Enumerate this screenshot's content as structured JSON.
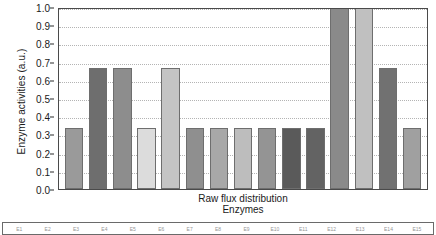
{
  "chart_data": {
    "type": "bar",
    "title": "Raw flux distribution",
    "xlabel": "Enzymes",
    "ylabel": "Enzyme activities (a.u.)",
    "ylim": [
      0.0,
      1.0
    ],
    "grid": true,
    "legend_position": "bottom",
    "ytick_labels": [
      "1.0",
      "0.9",
      "0.8",
      "0.7",
      "0.6",
      "0.5",
      "0.4",
      "0.3",
      "0.2",
      "0.1",
      "0.0"
    ],
    "ytick_values": [
      1.0,
      0.9,
      0.8,
      0.7,
      0.6,
      0.5,
      0.4,
      0.3,
      0.2,
      0.1,
      0.0
    ],
    "categories": [
      "E1",
      "E2",
      "E3",
      "E4",
      "E5",
      "E6",
      "E7",
      "E8",
      "E9",
      "E10",
      "E11",
      "E12",
      "E13",
      "E14",
      "E15"
    ],
    "values": [
      0.333,
      0.667,
      0.667,
      0.333,
      0.667,
      0.333,
      0.333,
      0.333,
      0.333,
      0.333,
      0.333,
      1.0,
      1.0,
      0.667,
      0.333
    ],
    "bar_colors": [
      "#9a9a9a",
      "#6e6e6e",
      "#8d8d8d",
      "#dcdcdc",
      "#c4c4c4",
      "#8f8f8f",
      "#a8a8a8",
      "#bdbdbd",
      "#949494",
      "#5a5a5a",
      "#636363",
      "#8a8a8a",
      "#c0c0c0",
      "#717171",
      "#a0a0a0"
    ]
  },
  "legend": {
    "entries": [
      "E1",
      "E2",
      "E3",
      "E4",
      "E5",
      "E6",
      "E7",
      "E8",
      "E9",
      "E10",
      "E11",
      "E12",
      "E13",
      "E14",
      "E15"
    ]
  }
}
